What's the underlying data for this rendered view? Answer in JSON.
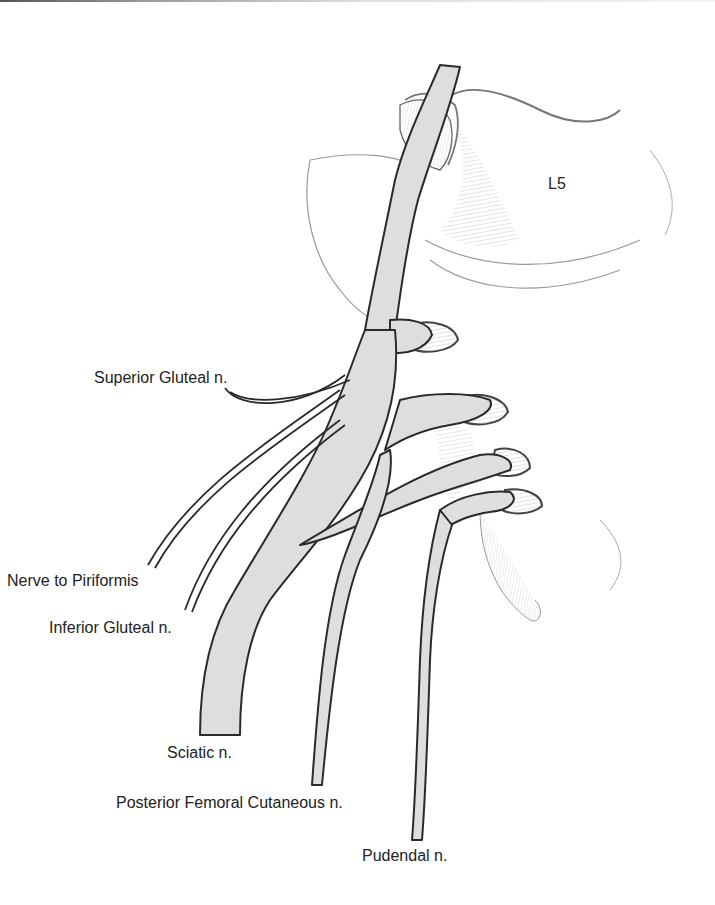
{
  "figure": {
    "colors": {
      "nerve_fill": "#dedede",
      "outline": "#2a2a2a",
      "sketch": "#9a9a9a",
      "background": "#ffffff"
    }
  },
  "labels": {
    "vertebra": "L5",
    "superior_gluteal": "Superior Gluteal n.",
    "nerve_to_piriformis": "Nerve to Piriformis",
    "inferior_gluteal": "Inferior Gluteal n.",
    "sciatic": "Sciatic n.",
    "posterior_femoral_cutaneous": "Posterior Femoral Cutaneous n.",
    "pudendal": "Pudendal n."
  }
}
